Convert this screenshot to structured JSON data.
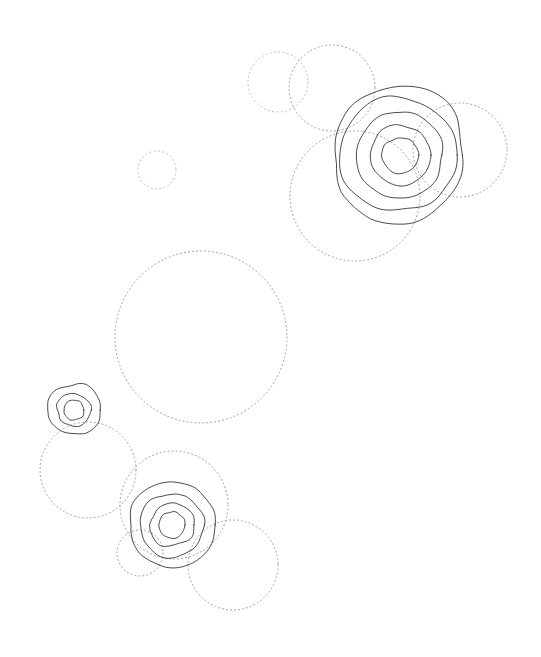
{
  "figure": {
    "type": "contour-density-plot",
    "width": 541,
    "height": 657,
    "background_color": "#ffffff",
    "contour_color": "#2b2b2b",
    "aperture_color": "#9a9a9a",
    "has_axes": false,
    "has_labels": false,
    "has_legend": false,
    "has_title": false
  },
  "chart_data": {
    "type": "scatter",
    "title": "",
    "xlabel": "",
    "ylabel": "",
    "xlim": [
      0,
      541
    ],
    "ylim": [
      0,
      657
    ],
    "grid": false,
    "legend_position": "none",
    "series": [
      {
        "name": "source-peak-north",
        "center": [
          400,
          155
        ],
        "levels": 5,
        "level_radii": [
          18,
          30,
          44,
          57,
          68
        ],
        "irregularity": 0.055
      },
      {
        "name": "source-peak-south",
        "center": [
          172,
          525
        ],
        "levels": 4,
        "level_radii": [
          13,
          22,
          32,
          42
        ],
        "irregularity": 0.065
      },
      {
        "name": "source-peak-west",
        "center": [
          74,
          410
        ],
        "levels": 3,
        "level_radii": [
          10,
          17,
          26
        ],
        "irregularity": 0.07
      }
    ],
    "apertures": [
      {
        "name": "aperture-01",
        "center": [
          278,
          82
        ],
        "radius": 30,
        "faint": true
      },
      {
        "name": "aperture-02",
        "center": [
          332,
          88
        ],
        "radius": 43,
        "faint": false
      },
      {
        "name": "aperture-03",
        "center": [
          460,
          150
        ],
        "radius": 47,
        "faint": false
      },
      {
        "name": "aperture-04",
        "center": [
          355,
          196
        ],
        "radius": 65,
        "faint": false
      },
      {
        "name": "aperture-05",
        "center": [
          157,
          170
        ],
        "radius": 19,
        "faint": true
      },
      {
        "name": "aperture-06",
        "center": [
          201,
          337
        ],
        "radius": 86,
        "faint": false
      },
      {
        "name": "aperture-07",
        "center": [
          88,
          470
        ],
        "radius": 48,
        "faint": false
      },
      {
        "name": "aperture-08",
        "center": [
          174,
          505
        ],
        "radius": 54,
        "faint": false
      },
      {
        "name": "aperture-09",
        "center": [
          140,
          553
        ],
        "radius": 23,
        "faint": false
      },
      {
        "name": "aperture-10",
        "center": [
          233,
          565
        ],
        "radius": 45,
        "faint": false
      }
    ]
  }
}
